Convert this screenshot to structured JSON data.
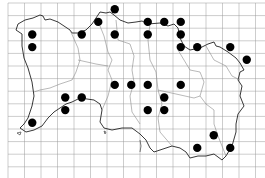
{
  "map": {
    "title": "",
    "type": "distribution grid map",
    "region": "island outline with parish boundaries",
    "grid": {
      "columns": 16,
      "rows": 14
    },
    "colors": {
      "background": "#ffffff",
      "grid": "#9a9a9a",
      "coast": "#222222",
      "boundary": "#8a8a8a",
      "dot": "#000000"
    },
    "records": [
      {
        "col": 6,
        "row": 0
      },
      {
        "col": 5,
        "row": 1
      },
      {
        "col": 8,
        "row": 1
      },
      {
        "col": 9,
        "row": 1
      },
      {
        "col": 10,
        "row": 1
      },
      {
        "col": 1,
        "row": 2
      },
      {
        "col": 4,
        "row": 2
      },
      {
        "col": 6,
        "row": 2
      },
      {
        "col": 8,
        "row": 2
      },
      {
        "col": 10,
        "row": 2
      },
      {
        "col": 1,
        "row": 3
      },
      {
        "col": 10,
        "row": 3
      },
      {
        "col": 11,
        "row": 3
      },
      {
        "col": 13,
        "row": 3
      },
      {
        "col": 14,
        "row": 4
      },
      {
        "col": 6,
        "row": 6
      },
      {
        "col": 7,
        "row": 6
      },
      {
        "col": 8,
        "row": 6
      },
      {
        "col": 10,
        "row": 6
      },
      {
        "col": 3,
        "row": 7
      },
      {
        "col": 4,
        "row": 7
      },
      {
        "col": 9,
        "row": 7
      },
      {
        "col": 3,
        "row": 8
      },
      {
        "col": 8,
        "row": 8
      },
      {
        "col": 9,
        "row": 8
      },
      {
        "col": 1,
        "row": 9
      },
      {
        "col": 12,
        "row": 10
      },
      {
        "col": 11,
        "row": 11
      },
      {
        "col": 13,
        "row": 11
      }
    ]
  }
}
